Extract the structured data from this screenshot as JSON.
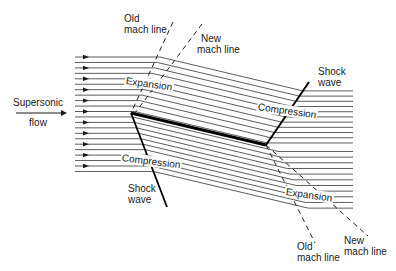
{
  "diagram": {
    "inflow_label": {
      "line1": "Supersonic",
      "line2": "flow"
    },
    "labels": {
      "old_mach_top": {
        "line1": "Old",
        "line2": "mach line"
      },
      "new_mach_top": {
        "line1": "New",
        "line2": "mach line"
      },
      "expansion_top": "Expansion",
      "compression_top": "Compression",
      "shock_top": {
        "line1": "Shock",
        "line2": "wave"
      },
      "compression_bottom": "Compression",
      "shock_bottom": {
        "line1": "Shock",
        "line2": "wave"
      },
      "expansion_bottom": "Expansion",
      "old_mach_bottom": {
        "line1": "Old",
        "line2": "mach line"
      },
      "new_mach_bottom": {
        "line1": "New",
        "line2": "mach line"
      }
    },
    "colors": {
      "line": "#1a1a1a",
      "streamline": "#333333",
      "background": "#ffffff"
    },
    "streamline_count": 22
  }
}
